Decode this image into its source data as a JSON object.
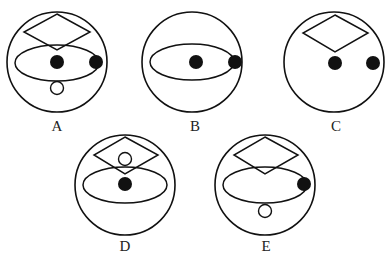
{
  "figures": [
    {
      "label": "A",
      "cx": 57,
      "cy": 62,
      "r": 50,
      "ellipse": {
        "cx": 57,
        "cy": 63,
        "rx": 42,
        "ry": 18
      },
      "diamond": {
        "top": [
          57,
          14
        ],
        "left": [
          24,
          32
        ],
        "right": [
          90,
          32
        ],
        "bottom": [
          57,
          50
        ]
      },
      "filled_dots": [
        [
          57,
          62
        ],
        [
          96,
          62
        ]
      ],
      "hollow_dots": [
        [
          57,
          88
        ]
      ]
    },
    {
      "label": "B",
      "cx": 192,
      "cy": 62,
      "r": 50,
      "ellipse": {
        "cx": 192,
        "cy": 62,
        "rx": 42,
        "ry": 18
      },
      "diamond": null,
      "filled_dots": [
        [
          196,
          62
        ],
        [
          235,
          62
        ]
      ],
      "hollow_dots": []
    },
    {
      "label": "C",
      "cx": 334,
      "cy": 62,
      "r": 50,
      "ellipse": null,
      "diamond": {
        "top": [
          335,
          15
        ],
        "left": [
          303,
          33
        ],
        "right": [
          368,
          33
        ],
        "bottom": [
          335,
          52
        ]
      },
      "filled_dots": [
        [
          335,
          63
        ],
        [
          373,
          63
        ]
      ],
      "hollow_dots": []
    },
    {
      "label": "D",
      "cx": 125,
      "cy": 185,
      "r": 50,
      "ellipse": {
        "cx": 125,
        "cy": 185,
        "rx": 42,
        "ry": 18
      },
      "diamond": {
        "top": [
          125,
          137
        ],
        "left": [
          94,
          155
        ],
        "right": [
          158,
          155
        ],
        "bottom": [
          125,
          174
        ]
      },
      "filled_dots": [
        [
          125,
          184
        ]
      ],
      "hollow_dots": [
        [
          125,
          159
        ]
      ]
    },
    {
      "label": "E",
      "cx": 265,
      "cy": 185,
      "r": 50,
      "ellipse": {
        "cx": 265,
        "cy": 185,
        "rx": 42,
        "ry": 18
      },
      "diamond": {
        "top": [
          265,
          137
        ],
        "left": [
          234,
          155
        ],
        "right": [
          298,
          155
        ],
        "bottom": [
          265,
          174
        ]
      },
      "filled_dots": [
        [
          304,
          184
        ]
      ],
      "hollow_dots": [
        [
          265,
          211
        ]
      ]
    }
  ],
  "labels": {
    "A": {
      "x": 57,
      "y": 118
    },
    "B": {
      "x": 195,
      "y": 118
    },
    "C": {
      "x": 336,
      "y": 118
    },
    "D": {
      "x": 125,
      "y": 238
    },
    "E": {
      "x": 266,
      "y": 238
    }
  },
  "colors": {
    "stroke": "#111111",
    "fill": "#111111",
    "background": "#ffffff"
  }
}
